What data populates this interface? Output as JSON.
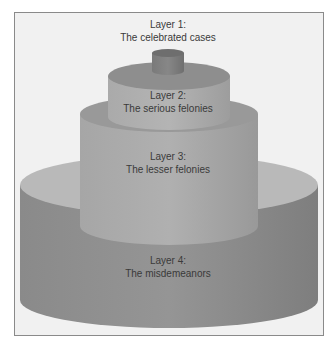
{
  "diagram": {
    "type": "tiered-cake",
    "layers": [
      {
        "title": "Layer 1:",
        "subtitle": "The celebrated cases"
      },
      {
        "title": "Layer 2:",
        "subtitle": "The serious felonies"
      },
      {
        "title": "Layer 3:",
        "subtitle": "The lesser felonies"
      },
      {
        "title": "Layer 4:",
        "subtitle": "The misdemeanors"
      }
    ],
    "colors": {
      "background": "#f1f1f1",
      "frame_border": "#8a8a8a",
      "tier_side": "#8c8c8c",
      "tier_top": "#b8b8b8",
      "tier_side_light": "#a8a8a8",
      "label_text": "#3a3a3a"
    }
  }
}
